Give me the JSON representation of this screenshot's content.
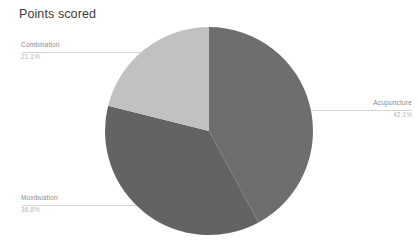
{
  "chart": {
    "title": "Points scored",
    "background_color": "#ffffff",
    "title_color": "#3c3c3c",
    "leader_line_color": "#d4d4d4",
    "label_name_color": "#8a8a8a",
    "label_pct_color": "#b4b4b4"
  },
  "chart_data": {
    "type": "pie",
    "title": "Points scored",
    "xlabel": "",
    "ylabel": "",
    "legend": "none",
    "grid": false,
    "labels_outside": true,
    "start_angle_deg": 0,
    "direction": "clockwise",
    "categories": [
      "Acupuncture",
      "Moxibustion",
      "Combination"
    ],
    "values": [
      42.1,
      36.8,
      21.1
    ],
    "value_unit": "%",
    "colors": [
      "#6e6e6e",
      "#636363",
      "#c1c1c1"
    ],
    "slices": [
      {
        "label": "Acupuncture",
        "percent": "42.1%",
        "value": 42.1,
        "color": "#6e6e6e",
        "start_deg": 0,
        "end_deg": 151.56,
        "callout_side": "right"
      },
      {
        "label": "Moxibustion",
        "percent": "36.8%",
        "value": 36.8,
        "color": "#636363",
        "start_deg": 151.56,
        "end_deg": 284.04,
        "callout_side": "left"
      },
      {
        "label": "Combination",
        "percent": "21.1%",
        "value": 21.1,
        "color": "#c1c1c1",
        "start_deg": 284.04,
        "end_deg": 360,
        "callout_side": "left"
      }
    ],
    "geometry": {
      "center_x": 209,
      "center_y": 131,
      "radius": 104
    }
  }
}
